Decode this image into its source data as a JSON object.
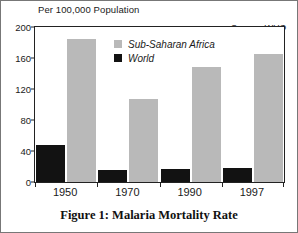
{
  "figure": {
    "units_title": "Per 100,000 Population",
    "source_note": "Source: WHO",
    "caption": "Figure 1: Malaria Mortality Rate"
  },
  "colors": {
    "sub_saharan_africa": "#b9b9b9",
    "world": "#121212",
    "axis": "#222222",
    "background": "#ffffff"
  },
  "chart_data": {
    "type": "bar",
    "title": "Figure 1: Malaria Mortality Rate",
    "subtitle": "Per 100,000 Population",
    "xlabel": "",
    "ylabel": "Per 100,000 Population",
    "categories": [
      "1950",
      "1970",
      "1990",
      "1997"
    ],
    "series": [
      {
        "name": "World",
        "color": "#121212",
        "values": [
          48,
          16,
          17,
          18
        ]
      },
      {
        "name": "Sub-Saharan Africa",
        "color": "#b9b9b9",
        "values": [
          184,
          107,
          148,
          165
        ]
      }
    ],
    "ylim": [
      0,
      200
    ],
    "yticks": [
      0,
      40,
      80,
      120,
      160,
      200
    ],
    "ytick_labels": [
      "0",
      "40",
      "80",
      "120",
      "160",
      "200"
    ],
    "grid": false,
    "legend": [
      "Sub-Saharan Africa",
      "World"
    ],
    "legend_position": "inside-top-center",
    "annotations": [
      "Source: WHO",
      "Per 100,000 Population"
    ]
  }
}
